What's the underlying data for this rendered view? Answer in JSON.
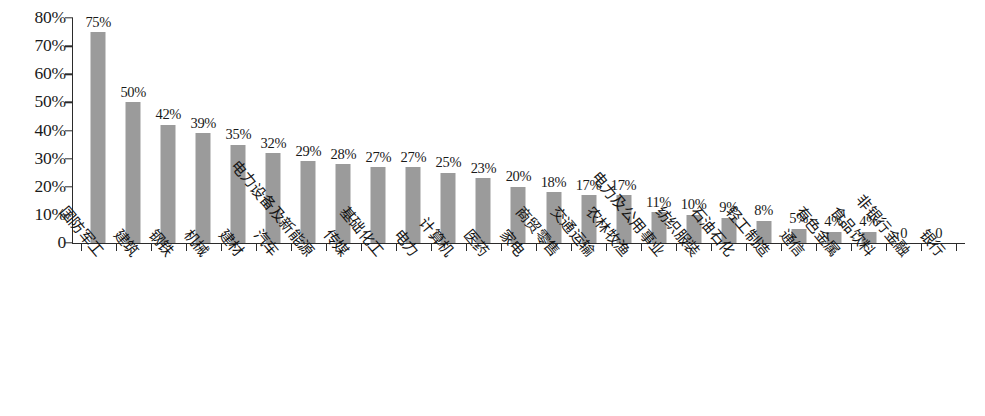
{
  "chart_data": {
    "type": "bar",
    "title": "",
    "subtitle": "",
    "xlabel": "",
    "ylabel": "",
    "ylim": [
      0,
      80
    ],
    "grid": false,
    "legend": null,
    "legend_position": "none",
    "value_suffix": "%",
    "bar_color": "#9b9b9b",
    "axis_color": "#2b2b2b",
    "background_color": "#ffffff",
    "y_ticks": [
      "80%",
      "70%",
      "60%",
      "50%",
      "40%",
      "30%",
      "20%",
      "10%",
      "0"
    ],
    "y_tick_values": [
      80,
      70,
      60,
      50,
      40,
      30,
      20,
      10,
      0
    ],
    "categories": [
      "国防军工",
      "建筑",
      "钢铁",
      "机械",
      "建材",
      "汽车",
      "电力设备及新能源",
      "传媒",
      "基础化工",
      "电力",
      "计算机",
      "医药",
      "家电",
      "商贸零售",
      "交通运输",
      "农林牧渔",
      "电力及公用事业",
      "纺织服装",
      "石油石化",
      "轻工制造",
      "通信",
      "有色金属",
      "食品饮料",
      "非银行金融",
      "银行"
    ],
    "values": [
      75,
      50,
      42,
      39,
      35,
      32,
      29,
      28,
      27,
      27,
      25,
      23,
      20,
      18,
      17,
      17,
      11,
      10,
      9,
      8,
      5,
      4,
      4,
      0,
      0
    ],
    "value_labels": [
      "75%",
      "50%",
      "42%",
      "39%",
      "35%",
      "32%",
      "29%",
      "28%",
      "27%",
      "27%",
      "25%",
      "23%",
      "20%",
      "18%",
      "17%",
      "17%",
      "11%",
      "10%",
      "9%",
      "8%",
      "5%",
      "4%",
      "4%",
      "0",
      "0"
    ]
  }
}
